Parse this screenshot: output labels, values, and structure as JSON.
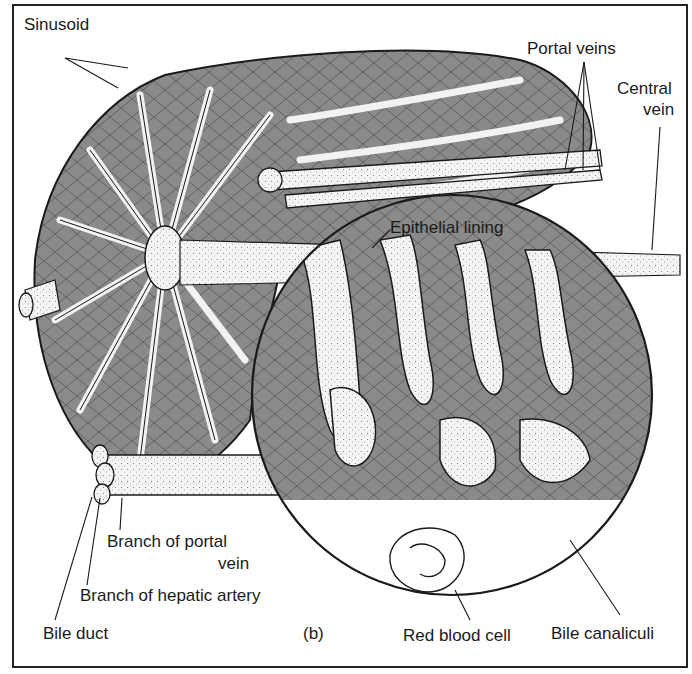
{
  "figure": {
    "panel_label": "(b)",
    "colors": {
      "hepatocyte_fill": "#8a8a8a",
      "sinusoid_fill": "#f2f2f2",
      "outline": "#1a1a1a",
      "background": "#ffffff"
    }
  },
  "labels": {
    "sinusoid": "Sinusoid",
    "portal_veins": "Portal veins",
    "central_vein_line1": "Central",
    "central_vein_line2": "vein",
    "epithelial_lining": "Epithelial lining",
    "branch_portal_vein_line1": "Branch of portal",
    "branch_portal_vein_line2": "vein",
    "branch_hepatic_artery": "Branch of hepatic artery",
    "bile_duct": "Bile duct",
    "red_blood_cell": "Red blood cell",
    "bile_canaliculi": "Bile canaliculi"
  }
}
